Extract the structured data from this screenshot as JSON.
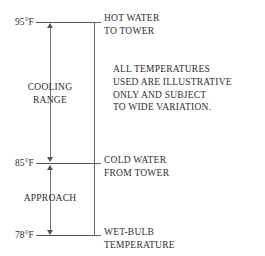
{
  "diagram": {
    "units": "°F",
    "line_color": "#555555",
    "text_color": "#2f2f2f",
    "background": "#ffffff"
  },
  "levels": [
    {
      "id": "hot-water",
      "temperature": "95°F",
      "value": 95,
      "right_label_line1": "HOT WATER",
      "right_label_line2": "TO TOWER",
      "y": 22
    },
    {
      "id": "cold-water",
      "temperature": "85°F",
      "value": 85,
      "right_label_line1": "COLD WATER",
      "right_label_line2": "FROM TOWER",
      "y": 163
    },
    {
      "id": "wet-bulb",
      "temperature": "78°F",
      "value": 78,
      "right_label_line1": "WET-BULB",
      "right_label_line2": "TEMPERATURE",
      "y": 235
    }
  ],
  "spans": [
    {
      "id": "cooling-range",
      "label_line1": "COOLING",
      "label_line2": "RANGE",
      "from": 95,
      "to": 85,
      "magnitude": 10
    },
    {
      "id": "approach",
      "label_line1": "APPROACH",
      "label_line2": "",
      "from": 85,
      "to": 78,
      "magnitude": 7
    }
  ],
  "note": {
    "lines": [
      "ALL TEMPERATURES",
      "USED ARE ILLUSTRATIVE",
      "ONLY AND SUBJECT",
      "TO WIDE VARIATION."
    ]
  }
}
